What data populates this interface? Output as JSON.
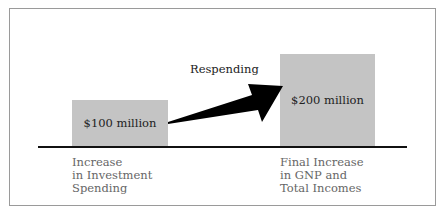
{
  "diagram": {
    "nodes": [
      {
        "id": "investment",
        "value_label": "$100 million",
        "caption": "Increase\nin Investment\nSpending"
      },
      {
        "id": "gnp",
        "value_label": "$200 million",
        "caption": "Final Increase\nin GNP and\nTotal Incomes"
      }
    ],
    "edge": {
      "from": "investment",
      "to": "gnp",
      "label": "Respending"
    },
    "colors": {
      "bar": "#c4c4c4",
      "arrow": "#000000",
      "axis": "#111111",
      "caption": "#666666"
    }
  }
}
